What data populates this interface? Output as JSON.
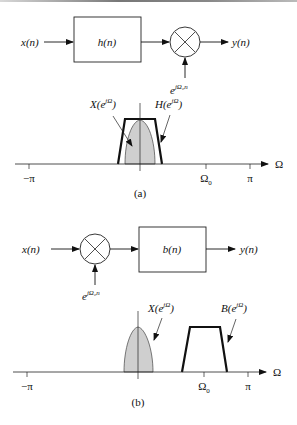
{
  "figure_a": {
    "input_label": "x(n)",
    "filter_label": "h(n)",
    "output_label": "y(n)",
    "modulator_label_base": "e",
    "modulator_label_exp": "jΩ₀n",
    "spectrum_labels": {
      "input": "X(e^jΩ)",
      "filter": "H(e^jΩ)"
    },
    "axis": {
      "variable": "Ω",
      "ticks": [
        "−π",
        "Ω₀",
        "π"
      ]
    },
    "caption": "(a)"
  },
  "figure_b": {
    "input_label": "x(n)",
    "filter_label": "b(n)",
    "output_label": "y(n)",
    "modulator_label_base": "e",
    "modulator_label_exp": "jΩ₀n",
    "spectrum_labels": {
      "input": "X(e^jΩ)",
      "filter": "B(e^jΩ)"
    },
    "axis": {
      "variable": "Ω",
      "ticks": [
        "−π",
        "Ω₀",
        "π"
      ]
    },
    "caption": "(b)"
  },
  "text": {
    "X": "X(e",
    "H": "H(e",
    "B": "B(e",
    "jO": "jΩ",
    "close": ")",
    "neg_pi": "−π",
    "pi": "π",
    "omega": "Ω",
    "omega0_base": "Ω",
    "omega0_sub": "0"
  }
}
